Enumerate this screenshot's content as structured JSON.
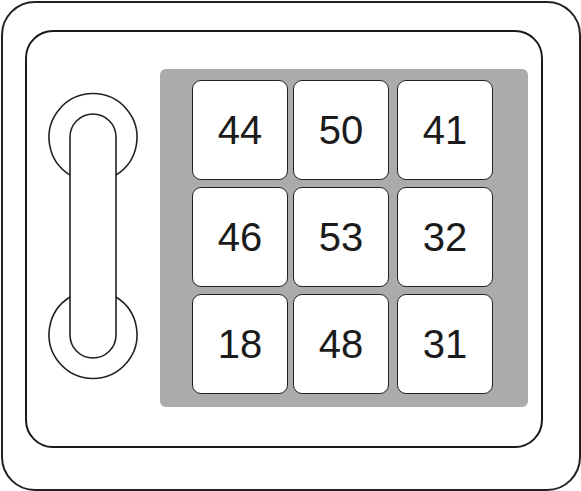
{
  "device": {
    "type": "keypad-safe",
    "colors": {
      "keypad_bg": "#ababab",
      "cell_bg": "#ffffff",
      "stroke": "#222222"
    }
  },
  "handle": {
    "label": "handle"
  },
  "keypad": {
    "rows": [
      [
        "44",
        "50",
        "41"
      ],
      [
        "46",
        "53",
        "32"
      ],
      [
        "18",
        "48",
        "31"
      ]
    ]
  }
}
